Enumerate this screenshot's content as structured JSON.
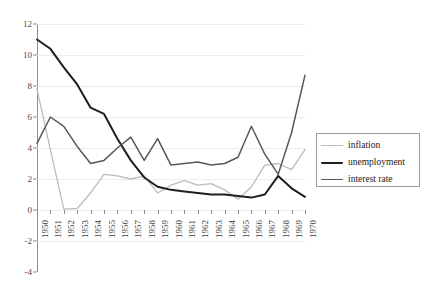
{
  "chart_data": {
    "type": "line",
    "title": "",
    "subtitle": "",
    "xlabel": "",
    "ylabel": "",
    "grid": true,
    "legend_position": "right",
    "xlim": [
      1950,
      1970
    ],
    "ylim": [
      -4,
      12
    ],
    "yticks": [
      12,
      10,
      8,
      6,
      4,
      2,
      0,
      -2,
      -4
    ],
    "x": [
      1950,
      1951,
      1952,
      1953,
      1954,
      1955,
      1956,
      1957,
      1958,
      1959,
      1960,
      1961,
      1962,
      1963,
      1964,
      1965,
      1966,
      1967,
      1968,
      1969,
      1970
    ],
    "categories": [
      "1950",
      "1951",
      "1952",
      "1953",
      "1954",
      "1955",
      "1956",
      "1957",
      "1958",
      "1959",
      "1960",
      "1961",
      "1962",
      "1963",
      "1964",
      "1965",
      "1966",
      "1967",
      "1968",
      "1969",
      "1970"
    ],
    "series": [
      {
        "name": "inflation",
        "color": "#bcbcbc",
        "width": 1.3,
        "values": [
          7.8,
          3.9,
          0.05,
          0.1,
          1.1,
          2.3,
          2.2,
          2.0,
          2.2,
          1.1,
          1.6,
          1.9,
          1.6,
          1.7,
          1.3,
          0.7,
          1.5,
          2.9,
          3.0,
          2.6,
          3.9
        ]
      },
      {
        "name": "unemployment",
        "color": "#1e1e1e",
        "width": 2.0,
        "values": [
          11.0,
          10.4,
          9.2,
          8.1,
          6.6,
          6.2,
          4.6,
          3.2,
          2.1,
          1.5,
          1.3,
          1.2,
          1.1,
          1.0,
          1.0,
          0.9,
          0.8,
          1.0,
          2.2,
          1.4,
          0.85
        ]
      },
      {
        "name": "interest rate",
        "color": "#585858",
        "width": 1.5,
        "values": [
          4.3,
          6.0,
          5.4,
          4.1,
          3.0,
          3.2,
          4.0,
          4.7,
          3.2,
          4.6,
          2.9,
          3.0,
          3.1,
          2.9,
          3.0,
          3.4,
          5.4,
          3.6,
          2.3,
          5.0,
          8.7
        ]
      }
    ]
  },
  "legend": {
    "items": [
      {
        "label": "inflation"
      },
      {
        "label": "unemployment"
      },
      {
        "label": "interest rate"
      }
    ]
  }
}
